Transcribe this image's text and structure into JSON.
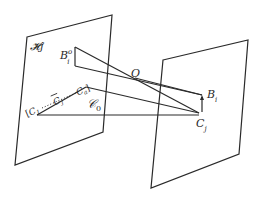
{
  "diagram": {
    "type": "geometric-projection",
    "planes": [
      {
        "id": "left-plane",
        "label": "𝓗j",
        "corners": [
          [
            27,
            37
          ],
          [
            112,
            15
          ],
          [
            103,
            132
          ],
          [
            15,
            165
          ]
        ]
      },
      {
        "id": "right-plane",
        "label": "",
        "corners": [
          [
            163,
            60
          ],
          [
            248,
            40
          ],
          [
            239,
            154
          ],
          [
            151,
            188
          ]
        ]
      }
    ],
    "points": {
      "B_i_o": {
        "label": "B",
        "sup": "o",
        "sub": "i",
        "x": 75,
        "y": 47
      },
      "O": {
        "label": "O",
        "x": 135,
        "y": 78
      },
      "B_i": {
        "label": "B",
        "sub": "i",
        "x": 202,
        "y": 95
      },
      "C_j": {
        "label": "C",
        "sub": "j",
        "x": 199,
        "y": 113
      },
      "C_0": {
        "label": "𝒞",
        "sub": "0",
        "x": 87,
        "y": 105
      }
    },
    "sequence_label": {
      "open": "[",
      "first": "C",
      "first_sub": "1",
      "middle": "C",
      "middle_sub": "j",
      "last": "C",
      "last_sub": "a",
      "close": "]",
      "dots": "……"
    },
    "line_color": "#2a2a2a"
  }
}
